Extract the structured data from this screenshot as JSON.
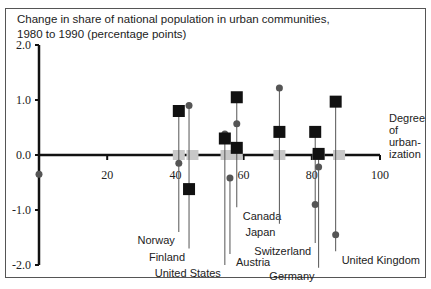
{
  "chart_data": {
    "type": "scatter",
    "title": "Change in share of national population in urban communities,",
    "subtitle": "1980 to 1990 (percentage points)",
    "xlabel": "Degree of urban- ization",
    "xlabel_lines": [
      "Degree",
      "of",
      "urban-",
      "ization"
    ],
    "ylabel": "",
    "xlim": [
      0,
      100
    ],
    "ylim": [
      -2.0,
      2.0
    ],
    "x_ticks": [
      0,
      20,
      40,
      60,
      80,
      100
    ],
    "x_tick_labels": [
      "0",
      "20",
      "40",
      "60",
      "80",
      "100"
    ],
    "y_ticks": [
      2.0,
      1.0,
      0.0,
      -1.0,
      -2.0
    ],
    "y_tick_labels": [
      "2.0",
      "1.0",
      "0.0",
      "-1.0",
      "-2.0"
    ],
    "grid": false,
    "legend": "none",
    "series_styles": {
      "square": {
        "color": "#111111",
        "shape": "square"
      },
      "circle": {
        "color": "#555555",
        "shape": "circle"
      },
      "gray": {
        "color": "#c8c8c8",
        "shape": "square"
      }
    },
    "countries": [
      {
        "name": "Norway",
        "x": 41,
        "square": 0.8,
        "circle": -0.15,
        "label_y": -1.55
      },
      {
        "name": "Finland",
        "x": 44,
        "square": -0.62,
        "circle": 0.9,
        "label_y": -1.85
      },
      {
        "name": "United States",
        "x": 54.5,
        "square": 0.3,
        "circle": 0.38,
        "label_y": -2.15
      },
      {
        "name": "Austria",
        "x": 56,
        "square": null,
        "circle": -0.42,
        "label_y": -1.95
      },
      {
        "name": "Canada",
        "x": 58,
        "square": 1.05,
        "square2": 0.13,
        "circle": 0.57,
        "label_y": -1.1
      },
      {
        "name": "Japan",
        "x": 70.5,
        "square": 0.42,
        "circle": 1.22,
        "label_y": -1.4
      },
      {
        "name": "Switzerland",
        "x": 81,
        "square": 0.42,
        "circle": -0.9,
        "label_y": -1.75
      },
      {
        "name": "Germany",
        "x": 82,
        "square": 0.02,
        "circle": -0.22,
        "label_y": -2.2
      },
      {
        "name": "United Kingdom",
        "x": 87,
        "square": 0.97,
        "circle": -1.45,
        "label_y": -1.9
      }
    ],
    "gray_markers_x": [
      41,
      45,
      55,
      58,
      70.5,
      82,
      88
    ],
    "origin_marker": {
      "x": 0,
      "y": -0.35
    }
  }
}
